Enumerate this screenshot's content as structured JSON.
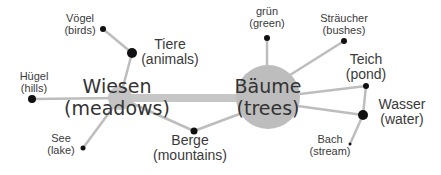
{
  "diagram": {
    "type": "mind-map",
    "colors": {
      "edge": "#bdbdbd",
      "main_edge": "#c4c4c4",
      "hub": "#bdbdbd",
      "dot": "#111111",
      "text": "#3a3a3a"
    },
    "hubs": [
      {
        "id": "wiesen",
        "de": "Wiesen",
        "en": "(meadows)"
      },
      {
        "id": "baeume",
        "de": "Bäume",
        "en": "(trees)"
      }
    ],
    "nodes": [
      {
        "id": "voegel",
        "de": "Vögel",
        "en": "(birds)"
      },
      {
        "id": "tiere",
        "de": "Tiere",
        "en": "(animals)"
      },
      {
        "id": "huegel",
        "de": "Hügel",
        "en": "(hills)"
      },
      {
        "id": "see",
        "de": "See",
        "en": "(lake)"
      },
      {
        "id": "berge",
        "de": "Berge",
        "en": "(mountains)"
      },
      {
        "id": "gruen",
        "de": "grün",
        "en": "(green)"
      },
      {
        "id": "straeucher",
        "de": "Sträucher",
        "en": "(bushes)"
      },
      {
        "id": "teich",
        "de": "Teich",
        "en": "(pond)"
      },
      {
        "id": "wasser",
        "de": "Wasser",
        "en": "(water)"
      },
      {
        "id": "bach",
        "de": "Bach",
        "en": "(stream)"
      }
    ],
    "edges": [
      [
        "wiesen",
        "baeume"
      ],
      [
        "wiesen",
        "tiere"
      ],
      [
        "tiere",
        "voegel"
      ],
      [
        "wiesen",
        "huegel"
      ],
      [
        "wiesen",
        "see"
      ],
      [
        "wiesen",
        "berge"
      ],
      [
        "berge",
        "baeume"
      ],
      [
        "baeume",
        "gruen"
      ],
      [
        "baeume",
        "straeucher"
      ],
      [
        "baeume",
        "teich"
      ],
      [
        "baeume",
        "wasser"
      ],
      [
        "teich",
        "wasser"
      ],
      [
        "wasser",
        "bach"
      ]
    ]
  }
}
